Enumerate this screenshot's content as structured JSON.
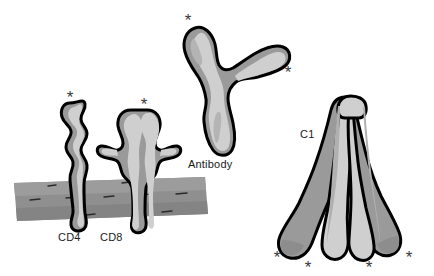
{
  "figure": {
    "background_color": "#ffffff",
    "outline_color": "#000000",
    "fill_light": "#cfcfcf",
    "fill_dark": "#9a9a9a",
    "membrane_color": "#8f8f8f",
    "asterisk_color": "#3a3a3a",
    "asterisk_glyph": "*"
  },
  "labels": {
    "cd4": "CD4",
    "cd8": "CD8",
    "antibody": "Antibody",
    "c1": "C1"
  },
  "markers": {
    "cd4_domain": "*",
    "cd8_domain": "*",
    "antibody_fab_left": "*",
    "antibody_fab_right": "*",
    "c1_arm_1": "*",
    "c1_arm_2": "*",
    "c1_arm_3": "*",
    "c1_arm_4": "*"
  }
}
